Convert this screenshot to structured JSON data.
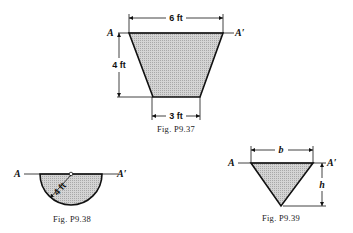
{
  "figures": [
    {
      "id": "P9.37",
      "caption": "Fig. P9.37",
      "shape": "trapezoid",
      "labels": {
        "top_width": "6 ft",
        "height": "4 ft",
        "bottom_width": "3 ft",
        "axis_left": "A",
        "axis_right": "A′"
      }
    },
    {
      "id": "P9.38",
      "caption": "Fig. P9.38",
      "shape": "semicircle",
      "labels": {
        "radius": "4 ft",
        "axis_left": "A",
        "axis_right": "A′"
      }
    },
    {
      "id": "P9.39",
      "caption": "Fig. P9.39",
      "shape": "inverted-triangle",
      "labels": {
        "base": "b",
        "height": "h",
        "axis_left": "A",
        "axis_right": "A′"
      }
    }
  ],
  "colors": {
    "fill": "#c8c8c8",
    "stroke": "#111111"
  }
}
